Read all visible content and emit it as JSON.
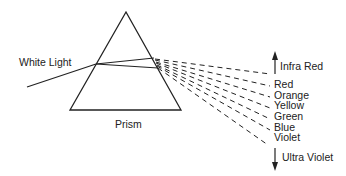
{
  "labels": {
    "white_light": "White Light",
    "prism": "Prism",
    "infra_red": "Infra Red",
    "ultra_violet": "Ultra Violet"
  },
  "spectrum": [
    "Red",
    "Orange",
    "Yellow",
    "Green",
    "Blue",
    "Violet"
  ],
  "colors": {
    "stroke": "#222222",
    "background": "#ffffff"
  }
}
